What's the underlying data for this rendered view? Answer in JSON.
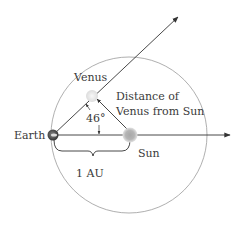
{
  "diagram": {
    "type": "venus-elongation-geometry",
    "labels": {
      "venus": "Venus",
      "earth": "Earth",
      "sun": "Sun",
      "distance_line1": "Distance of",
      "distance_line2": "Venus from Sun",
      "angle": "46°",
      "au": "1 AU"
    },
    "colors": {
      "line": "#333333",
      "orbit": "#9a9a9a",
      "text": "#3a3a3a",
      "sun": "#b8b8b8",
      "earth": "#555555",
      "venus": "#eeeeee"
    },
    "angle_degrees": 46
  }
}
